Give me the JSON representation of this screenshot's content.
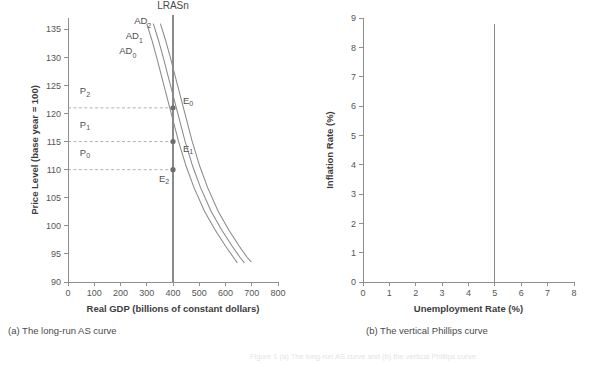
{
  "figure": {
    "background_color": "#ffffff",
    "ink_color": "#8a8a8a",
    "text_color": "#4a4a4a",
    "bleed_text": "Figure 1 (a) The long-run AS curve and (b) the vertical Phillips curve"
  },
  "panel_a": {
    "caption": "(a) The long-run AS curve",
    "lras_label": "LRASn",
    "price_labels": [
      "P",
      "P",
      "P"
    ],
    "equilibrium_labels": [
      "E",
      "E",
      "E"
    ],
    "chart_data": {
      "type": "line",
      "title": "(a) The long-run AS curve",
      "xlabel": "Real GDP (billions of constant dollars)",
      "ylabel": "Price Level (base year = 100)",
      "xlim": [
        0,
        800
      ],
      "ylim": [
        90,
        137
      ],
      "xticks": [
        0,
        100,
        200,
        300,
        400,
        500,
        600,
        700,
        800
      ],
      "xtick_labels": [
        "0",
        "100",
        "200",
        "300",
        "400",
        "500",
        "600",
        "700",
        "800"
      ],
      "yticks": [
        90,
        95,
        100,
        105,
        110,
        115,
        120,
        125,
        130,
        135
      ],
      "ytick_labels": [
        "90",
        "95",
        "100",
        "105",
        "110",
        "115",
        "120",
        "125",
        "130",
        "135"
      ],
      "grid": false,
      "legend": "none",
      "series": [
        {
          "name": "AD0",
          "label": "AD",
          "subscript": "0",
          "label_x": 195,
          "label_y": 130.6,
          "points": [
            [
              300,
              136.0
            ],
            [
              320,
              133.0
            ],
            [
              340,
              129.6
            ],
            [
              360,
              126.0
            ],
            [
              380,
              122.4
            ],
            [
              400,
              118.8
            ],
            [
              420,
              115.2
            ],
            [
              450,
              110.6
            ],
            [
              480,
              106.8
            ],
            [
              520,
              102.6
            ],
            [
              560,
              99.3
            ],
            [
              600,
              96.4
            ],
            [
              630,
              94.4
            ],
            [
              645,
              93.4
            ]
          ]
        },
        {
          "name": "AD1",
          "label": "AD",
          "subscript": "1",
          "label_x": 220,
          "label_y": 133.3,
          "points": [
            [
              325,
              136.0
            ],
            [
              345,
              133.0
            ],
            [
              365,
              129.6
            ],
            [
              385,
              126.0
            ],
            [
              405,
              122.4
            ],
            [
              425,
              118.8
            ],
            [
              445,
              115.2
            ],
            [
              475,
              110.6
            ],
            [
              505,
              106.8
            ],
            [
              545,
              102.6
            ],
            [
              585,
              99.3
            ],
            [
              625,
              96.4
            ],
            [
              655,
              94.4
            ],
            [
              672,
              93.4
            ]
          ]
        },
        {
          "name": "AD2",
          "label": "AD",
          "subscript": "2",
          "label_x": 252,
          "label_y": 136.0,
          "points": [
            [
              352,
              136.0
            ],
            [
              372,
              133.0
            ],
            [
              392,
              129.6
            ],
            [
              412,
              126.0
            ],
            [
              432,
              122.4
            ],
            [
              452,
              118.8
            ],
            [
              472,
              115.2
            ],
            [
              502,
              110.6
            ],
            [
              532,
              106.8
            ],
            [
              572,
              102.6
            ],
            [
              612,
              99.3
            ],
            [
              652,
              96.4
            ],
            [
              682,
              94.4
            ],
            [
              698,
              93.6
            ]
          ]
        }
      ],
      "vertical_line": {
        "name": "LRASn",
        "label": "LRASn",
        "x": 400,
        "y_from": 90,
        "y_to": 137.6
      },
      "annotations": [
        {
          "name": "E0",
          "label": "E",
          "subscript": "0",
          "x": 400,
          "y": 121,
          "dx": 10,
          "dy": -4
        },
        {
          "name": "E1",
          "label": "E",
          "subscript": "1",
          "x": 400,
          "y": 115,
          "dx": 10,
          "dy": 10
        },
        {
          "name": "E2",
          "label": "E",
          "subscript": "2",
          "x": 400,
          "y": 110,
          "dx": -14,
          "dy": 12
        }
      ],
      "reference_lines": [
        {
          "name": "P2",
          "label": "P",
          "subscript": "2",
          "y": 121,
          "x_from": 0,
          "x_to": 400,
          "label_x": 45,
          "label_y": 123.4
        },
        {
          "name": "P1",
          "label": "P",
          "subscript": "1",
          "y": 115,
          "x_from": 0,
          "x_to": 400,
          "label_x": 45,
          "label_y": 117.4
        },
        {
          "name": "P0",
          "label": "P",
          "subscript": "0",
          "y": 110,
          "x_from": 0,
          "x_to": 400,
          "label_x": 45,
          "label_y": 112.4
        }
      ]
    }
  },
  "panel_b": {
    "caption": "(b) The vertical Phillips curve",
    "chart_data": {
      "type": "line",
      "title": "(b) The vertical Phillips curve",
      "xlabel": "Unemployment Rate (%)",
      "ylabel": "Inflation Rate (%)",
      "xlim": [
        0,
        8
      ],
      "ylim": [
        0,
        9
      ],
      "xticks": [
        0,
        1,
        2,
        3,
        4,
        5,
        6,
        7,
        8
      ],
      "xtick_labels": [
        "0",
        "1",
        "2",
        "3",
        "4",
        "5",
        "6",
        "7",
        "8"
      ],
      "yticks": [
        0,
        1,
        2,
        3,
        4,
        5,
        6,
        7,
        8,
        9
      ],
      "ytick_labels": [
        "0",
        "1",
        "2",
        "3",
        "4",
        "5",
        "6",
        "7",
        "8",
        "9"
      ],
      "grid": false,
      "legend": "none",
      "series": [],
      "vertical_line": {
        "name": "natural-rate-phillips-curve",
        "x": 5,
        "y_from": 0,
        "y_to": 8.8
      }
    }
  }
}
